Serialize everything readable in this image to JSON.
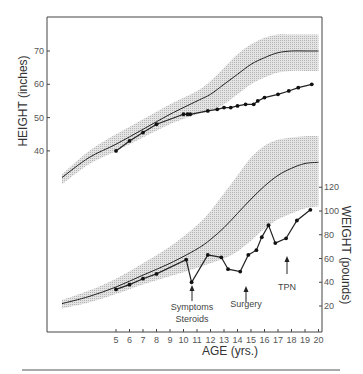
{
  "chart_data": [
    {
      "type": "line",
      "title": "",
      "xlabel": "AGE (yrs.)",
      "ylabel": "HEIGHT (inches)",
      "yaxis_side": "left",
      "yticks": [
        40,
        50,
        60,
        70
      ],
      "xticks": [
        5,
        6,
        7,
        8,
        9,
        10,
        11,
        12,
        13,
        14,
        15,
        16,
        17,
        18,
        19,
        20
      ],
      "xlim": [
        1,
        20
      ],
      "grid": false,
      "series": [
        {
          "name": "Patient height",
          "marker": "dot",
          "x": [
            5,
            6,
            7,
            8,
            10,
            10.3,
            10.5,
            11.8,
            12.5,
            13,
            13.5,
            14,
            14.6,
            15.2,
            15.5,
            16,
            17,
            17.8,
            18.5,
            19.5
          ],
          "values": [
            40,
            43,
            45.5,
            48,
            51,
            51,
            51,
            52,
            52.5,
            53,
            53,
            53.5,
            54,
            54,
            55,
            56,
            57,
            58,
            59,
            60
          ]
        },
        {
          "name": "Normal height (50th percentile)",
          "marker": "none",
          "x": [
            1,
            3,
            5,
            7,
            9,
            11,
            12,
            13,
            14,
            15,
            16,
            17,
            18,
            19,
            20
          ],
          "values": [
            32,
            38,
            42,
            46.5,
            51,
            55,
            57,
            60,
            63,
            66,
            68,
            69.5,
            70,
            70,
            70
          ]
        },
        {
          "name": "Normal height range (shaded)",
          "marker": "none",
          "x": [
            1,
            3,
            5,
            7,
            9,
            11,
            12,
            13,
            14,
            15,
            16,
            17,
            18,
            19,
            20
          ],
          "lower": [
            30,
            36,
            40,
            44,
            48,
            51,
            52,
            54,
            57,
            60,
            62,
            63.5,
            64,
            64,
            64
          ],
          "upper": [
            33,
            40,
            45,
            49.5,
            54,
            58,
            61,
            65,
            69,
            72,
            74,
            75,
            75,
            75,
            75
          ]
        }
      ]
    },
    {
      "type": "line",
      "title": "",
      "xlabel": "AGE (yrs.)",
      "ylabel": "WEIGHT (pounds)",
      "yaxis_side": "right",
      "yticks": [
        20,
        40,
        60,
        80,
        100,
        120
      ],
      "xticks": [
        5,
        6,
        7,
        8,
        9,
        10,
        11,
        12,
        13,
        14,
        15,
        16,
        17,
        18,
        19,
        20
      ],
      "xlim": [
        1,
        20
      ],
      "grid": false,
      "series": [
        {
          "name": "Patient weight",
          "marker": "dot",
          "x": [
            5,
            6,
            7,
            8,
            10.2,
            10.6,
            11.8,
            12.8,
            13.3,
            14.2,
            14.8,
            15.4,
            15.8,
            16.3,
            16.8,
            17.6,
            18.4,
            19.4
          ],
          "values": [
            34,
            38,
            43,
            47,
            59,
            40,
            63,
            61,
            51,
            49,
            63,
            67,
            78,
            88,
            73,
            77,
            92,
            101
          ]
        },
        {
          "name": "Normal weight (50th percentile)",
          "marker": "none",
          "x": [
            1,
            3,
            5,
            7,
            9,
            11,
            12,
            13,
            14,
            15,
            16,
            17,
            18,
            19,
            20
          ],
          "values": [
            22,
            28,
            36,
            46,
            56,
            68,
            76,
            86,
            98,
            110,
            121,
            130,
            136,
            140,
            141
          ]
        },
        {
          "name": "Normal weight range (shaded)",
          "marker": "none",
          "x": [
            1,
            3,
            5,
            7,
            9,
            11,
            12,
            13,
            14,
            15,
            16,
            17,
            18,
            19,
            20
          ],
          "lower": [
            18,
            23,
            30,
            38,
            45,
            52,
            56,
            60,
            66,
            75,
            85,
            93,
            98,
            102,
            104
          ],
          "upper": [
            25,
            33,
            43,
            56,
            70,
            88,
            100,
            115,
            130,
            145,
            155,
            160,
            162,
            163,
            163
          ]
        }
      ],
      "annotations": [
        {
          "text": "Symptoms",
          "x": 10.6,
          "arrow": true
        },
        {
          "text": "Steroids",
          "x": 10.6,
          "arrow": false
        },
        {
          "text": "Surgery",
          "x": 14.2,
          "arrow": true
        },
        {
          "text": "TPN",
          "x": 17.3,
          "arrow": true
        }
      ]
    }
  ],
  "labels": {
    "height_axis": "HEIGHT (inches)",
    "weight_axis": "WEIGHT (pounds)",
    "age_axis": "AGE (yrs.)",
    "symptoms": "Symptoms",
    "steroids": "Steroids",
    "surgery": "Surgery",
    "tpn": "TPN"
  }
}
